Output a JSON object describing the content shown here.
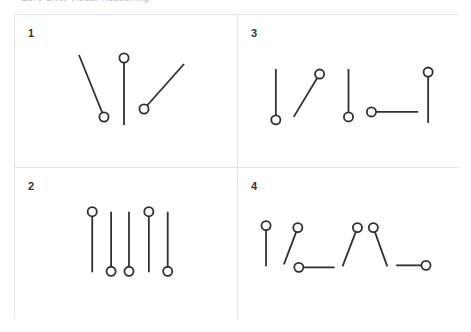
{
  "caption": {
    "text": "Zero Shot Visual Reasoning",
    "visible_fragment": "(top cropped text row)"
  },
  "figure": {
    "background_color": "#ffffff",
    "border_color": "#e3e3e5",
    "stroke_color": "#2f2f35",
    "stroke_width": 1.8,
    "marker_radius": 4.6,
    "marker_fill": "#ffffff",
    "grid_rows": 2,
    "grid_cols": 2
  },
  "panels": [
    {
      "id": "panel-1",
      "number": "1",
      "position": "top-left",
      "item_count": 3,
      "items": [
        {
          "name": "pin-1",
          "x1": 64,
          "y1": 40,
          "x2": 89,
          "y2": 102,
          "cx": 89,
          "cy": 102,
          "circle_end": "bottom",
          "orientation": "diagonal-down-right"
        },
        {
          "name": "pin-2",
          "x1": 109,
          "y1": 43,
          "x2": 109,
          "y2": 110,
          "cx": 109,
          "cy": 43,
          "circle_end": "top",
          "orientation": "vertical"
        },
        {
          "name": "pin-3",
          "x1": 169,
          "y1": 49,
          "x2": 129,
          "y2": 94,
          "cx": 129,
          "cy": 94,
          "circle_end": "bottom",
          "orientation": "diagonal-up-right"
        }
      ]
    },
    {
      "id": "panel-2",
      "number": "2",
      "position": "bottom-left",
      "item_count": 5,
      "items": [
        {
          "name": "pin-1",
          "x1": 77,
          "y1": 44,
          "x2": 77,
          "y2": 105,
          "cx": 77,
          "cy": 44,
          "circle_end": "top",
          "orientation": "vertical"
        },
        {
          "name": "pin-2",
          "x1": 96,
          "y1": 44,
          "x2": 96,
          "y2": 104,
          "cx": 96,
          "cy": 104,
          "circle_end": "bottom",
          "orientation": "vertical"
        },
        {
          "name": "pin-3",
          "x1": 114,
          "y1": 44,
          "x2": 114,
          "y2": 104,
          "cx": 114,
          "cy": 104,
          "circle_end": "bottom",
          "orientation": "vertical"
        },
        {
          "name": "pin-4",
          "x1": 134,
          "y1": 44,
          "x2": 134,
          "y2": 105,
          "cx": 134,
          "cy": 44,
          "circle_end": "top",
          "orientation": "vertical"
        },
        {
          "name": "pin-5",
          "x1": 153,
          "y1": 44,
          "x2": 153,
          "y2": 104,
          "cx": 153,
          "cy": 104,
          "circle_end": "bottom",
          "orientation": "vertical"
        }
      ]
    },
    {
      "id": "panel-3",
      "number": "3",
      "position": "top-right",
      "item_count": 5,
      "items": [
        {
          "name": "pin-1",
          "x1": 38,
          "y1": 54,
          "x2": 38,
          "y2": 105,
          "cx": 38,
          "cy": 105,
          "circle_end": "bottom",
          "orientation": "vertical"
        },
        {
          "name": "pin-2",
          "x1": 56,
          "y1": 102,
          "x2": 82,
          "y2": 59,
          "cx": 82,
          "cy": 59,
          "circle_end": "top",
          "orientation": "diagonal-up-right"
        },
        {
          "name": "pin-3",
          "x1": 111,
          "y1": 54,
          "x2": 111,
          "y2": 102,
          "cx": 111,
          "cy": 102,
          "circle_end": "bottom",
          "orientation": "vertical"
        },
        {
          "name": "pin-4",
          "x1": 134,
          "y1": 97,
          "x2": 181,
          "y2": 97,
          "cx": 134,
          "cy": 97,
          "circle_end": "left",
          "orientation": "horizontal"
        },
        {
          "name": "pin-5",
          "x1": 191,
          "y1": 57,
          "x2": 191,
          "y2": 108,
          "cx": 191,
          "cy": 57,
          "circle_end": "top",
          "orientation": "vertical"
        }
      ]
    },
    {
      "id": "panel-4",
      "number": "4",
      "position": "bottom-right",
      "item_count": 6,
      "items": [
        {
          "name": "pin-1",
          "x1": 28,
          "y1": 58,
          "x2": 28,
          "y2": 99,
          "cx": 28,
          "cy": 58,
          "circle_end": "top",
          "orientation": "vertical"
        },
        {
          "name": "pin-2",
          "x1": 60,
          "y1": 60,
          "x2": 46,
          "y2": 97,
          "cx": 60,
          "cy": 60,
          "circle_end": "top",
          "orientation": "diagonal-down-left"
        },
        {
          "name": "pin-3",
          "x1": 61,
          "y1": 100,
          "x2": 97,
          "y2": 100,
          "cx": 61,
          "cy": 100,
          "circle_end": "left",
          "orientation": "horizontal"
        },
        {
          "name": "pin-4",
          "x1": 120,
          "y1": 60,
          "x2": 105,
          "y2": 99,
          "cx": 120,
          "cy": 60,
          "circle_end": "top",
          "orientation": "diagonal-down-left"
        },
        {
          "name": "pin-5",
          "x1": 136,
          "y1": 60,
          "x2": 150,
          "y2": 99,
          "cx": 136,
          "cy": 60,
          "circle_end": "top",
          "orientation": "diagonal-down-right"
        },
        {
          "name": "pin-6",
          "x1": 159,
          "y1": 98,
          "x2": 189,
          "y2": 98,
          "cx": 189,
          "cy": 98,
          "circle_end": "right",
          "orientation": "horizontal"
        }
      ]
    }
  ]
}
